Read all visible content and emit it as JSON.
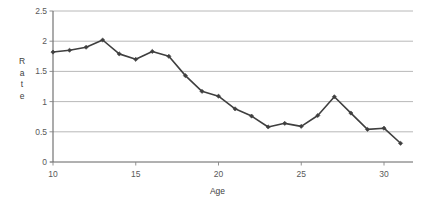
{
  "chart_data": {
    "type": "line",
    "title": "",
    "xlabel": "Age",
    "ylabel": "Rate",
    "ylabel_letters": [
      "R",
      "a",
      "t",
      "e"
    ],
    "x": [
      10,
      11,
      12,
      13,
      14,
      15,
      16,
      17,
      18,
      19,
      20,
      21,
      22,
      23,
      24,
      25,
      26,
      27,
      28,
      29,
      30,
      31
    ],
    "values": [
      1.82,
      1.85,
      1.9,
      2.02,
      1.79,
      1.7,
      1.83,
      1.75,
      1.43,
      1.17,
      1.09,
      0.88,
      0.76,
      0.58,
      0.64,
      0.59,
      0.77,
      1.08,
      0.81,
      0.54,
      0.56,
      0.31
    ],
    "series": [
      {
        "name": "Rate",
        "values": [
          1.82,
          1.85,
          1.9,
          2.02,
          1.79,
          1.7,
          1.83,
          1.75,
          1.43,
          1.17,
          1.09,
          0.88,
          0.76,
          0.58,
          0.64,
          0.59,
          0.77,
          1.08,
          0.81,
          0.54,
          0.56,
          0.31
        ]
      }
    ],
    "xlim": [
      10,
      32
    ],
    "ylim": [
      0,
      2.5
    ],
    "xticks": [
      10,
      15,
      20,
      25,
      30
    ],
    "xtick_labels": [
      "10",
      "15",
      "20",
      "25",
      "30"
    ],
    "yticks": [
      0,
      0.5,
      1,
      1.5,
      2,
      2.5
    ],
    "ytick_labels": [
      "0",
      "0.5",
      "1",
      "1.5",
      "2",
      "2.5"
    ],
    "grid": "horizontal",
    "legend": "none",
    "line_color": "#3f3f3f",
    "marker": "diamond",
    "marker_color": "#3f3f3f",
    "gridline_color": "#a6a6a6",
    "axis_color": "#868686",
    "background": "#ffffff"
  }
}
